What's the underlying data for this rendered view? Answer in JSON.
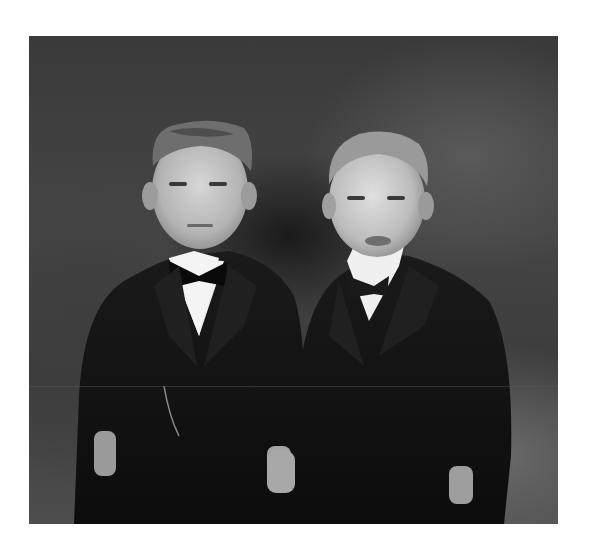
{
  "image": {
    "description": "Black-and-white portrait photograph of two men in dark suits with white collars and bow ties, standing side by side against a blurred dark background",
    "tone": "monochrome",
    "subjects": [
      {
        "position": "left",
        "hair": "light, brushed up",
        "attire": "dark suit jacket, waistcoat with watch chain, white shirt, black bow tie"
      },
      {
        "position": "right",
        "hair": "light, combed back",
        "attire": "dark suit jacket, waistcoat, white shirt, dark bow tie"
      }
    ],
    "colors": {
      "page_background": "#ffffff",
      "background_dark": "#3a3a3a",
      "suit": "#121212",
      "skin": "#c8c8c8",
      "collar": "#f2f2f2"
    }
  }
}
